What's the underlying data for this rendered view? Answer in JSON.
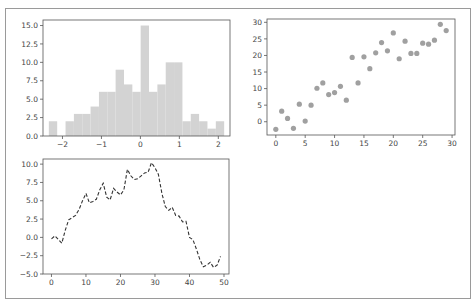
{
  "figure": {
    "background": "#ffffff",
    "frame_color": "#9a9a9a",
    "bar_color": "#d3d3d3",
    "point_color": "#a0a0a0",
    "line_color": "#333333"
  },
  "chart_data": [
    {
      "type": "bar",
      "subtype": "histogram",
      "title": "",
      "xlabel": "",
      "ylabel": "",
      "bin_edges": [
        -2.35,
        -2.136,
        -1.921,
        -1.707,
        -1.493,
        -1.279,
        -1.064,
        -0.85,
        -0.636,
        -0.421,
        -0.207,
        0.007,
        0.221,
        0.436,
        0.65,
        0.864,
        1.079,
        1.293,
        1.507,
        1.721,
        1.936,
        2.15
      ],
      "values": [
        2,
        0,
        2,
        3,
        3,
        4,
        6,
        6,
        9,
        7,
        6,
        15,
        6,
        7,
        10,
        10,
        2,
        3,
        2,
        1,
        2
      ],
      "xlim": [
        -2.5,
        2.3
      ],
      "ylim": [
        0,
        15.75
      ],
      "xticks": [
        -2,
        -1,
        0,
        1,
        2
      ],
      "xtick_labels": [
        "−2",
        "−1",
        "0",
        "1",
        "2"
      ],
      "yticks": [
        0,
        2.5,
        5,
        7.5,
        10,
        12.5,
        15
      ],
      "ytick_labels": [
        "0.0",
        "2.5",
        "5.0",
        "7.5",
        "10.0",
        "12.5",
        "15.0"
      ],
      "grid": false,
      "legend": null
    },
    {
      "type": "scatter",
      "title": "",
      "xlabel": "",
      "ylabel": "",
      "x": [
        0,
        1,
        2,
        3,
        4,
        5,
        6,
        7,
        8,
        9,
        10,
        11,
        12,
        13,
        14,
        15,
        16,
        17,
        18,
        19,
        20,
        21,
        22,
        23,
        24,
        25,
        26,
        27,
        28,
        29
      ],
      "y": [
        -2.3,
        3.2,
        1.0,
        -2.0,
        5.3,
        0.2,
        5.0,
        10.1,
        11.7,
        8.2,
        8.8,
        10.7,
        6.5,
        19.4,
        11.7,
        19.6,
        16.0,
        20.8,
        23.9,
        21.4,
        26.8,
        19.0,
        24.3,
        20.6,
        20.6,
        23.7,
        23.4,
        24.6,
        29.4,
        27.5
      ],
      "xlim": [
        -1.5,
        30.5
      ],
      "ylim": [
        -4,
        31
      ],
      "xticks": [
        0,
        5,
        10,
        15,
        20,
        25,
        30
      ],
      "xtick_labels": [
        "0",
        "5",
        "10",
        "15",
        "20",
        "25",
        "30"
      ],
      "yticks": [
        0,
        5,
        10,
        15,
        20,
        25,
        30
      ],
      "ytick_labels": [
        "0",
        "5",
        "10",
        "15",
        "20",
        "25",
        "30"
      ],
      "grid": false,
      "legend": null
    },
    {
      "type": "line",
      "style": "dashed",
      "title": "",
      "xlabel": "",
      "ylabel": "",
      "x": [
        0,
        1,
        2,
        3,
        4,
        5,
        6,
        7,
        8,
        9,
        10,
        11,
        12,
        13,
        14,
        15,
        16,
        17,
        18,
        19,
        20,
        21,
        22,
        23,
        24,
        25,
        26,
        27,
        28,
        29,
        30,
        31,
        32,
        33,
        34,
        35,
        36,
        37,
        38,
        39,
        40,
        41,
        42,
        43,
        44,
        45,
        46,
        47,
        48,
        49
      ],
      "y": [
        -0.2,
        0.2,
        -0.3,
        -0.8,
        1.0,
        2.4,
        2.7,
        3.0,
        3.8,
        5.0,
        6.0,
        4.7,
        4.9,
        5.2,
        6.5,
        7.4,
        5.5,
        5.1,
        6.7,
        6.2,
        5.8,
        6.5,
        9.3,
        8.4,
        7.9,
        8.0,
        8.4,
        8.8,
        8.9,
        10.2,
        9.5,
        8.6,
        6.0,
        4.2,
        3.7,
        4.1,
        3.0,
        2.9,
        2.1,
        2.2,
        0.0,
        -0.3,
        -1.6,
        -3.0,
        -4.0,
        -3.8,
        -3.4,
        -4.1,
        -3.8,
        -2.6
      ],
      "xlim": [
        -2.45,
        51.45
      ],
      "ylim": [
        -5,
        10.7
      ],
      "xticks": [
        0,
        10,
        20,
        30,
        40,
        50
      ],
      "xtick_labels": [
        "0",
        "10",
        "20",
        "30",
        "40",
        "50"
      ],
      "yticks": [
        -5,
        -2.5,
        0,
        2.5,
        5,
        7.5,
        10
      ],
      "ytick_labels": [
        "−5.0",
        "−2.5",
        "0.0",
        "2.5",
        "5.0",
        "7.5",
        "10.0"
      ],
      "grid": false,
      "legend": null
    }
  ]
}
